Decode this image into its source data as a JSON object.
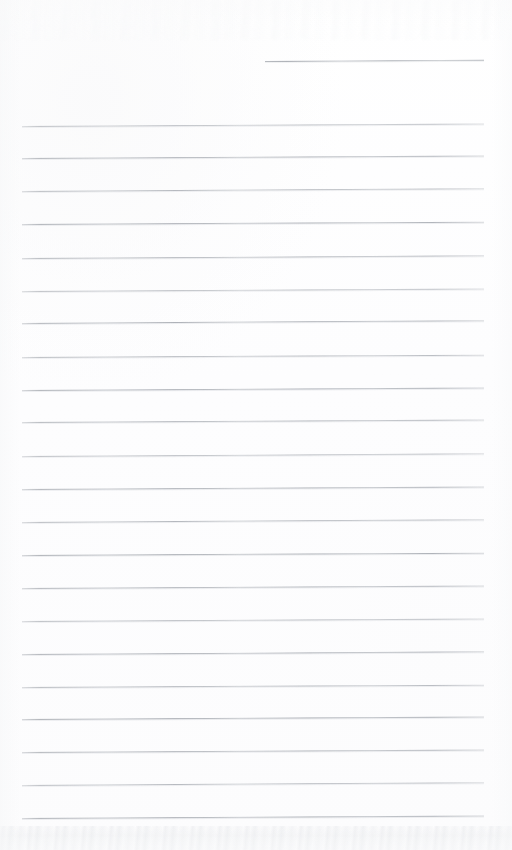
{
  "document": {
    "type": "blank-ruled-paper-scan",
    "title": "Blank Ruled Notebook Page",
    "page_width": 512,
    "page_height": 850,
    "background_color": "#fefefe",
    "rule_color": "#acb0b6",
    "rule_thickness_px": 1,
    "rule_left_x": 22,
    "rule_right_x": 484,
    "rule_spacing_px": 32.5,
    "written_text": "",
    "header_note": ""
  },
  "header_rule": {
    "label": "date-rule",
    "x": 265,
    "y": 61,
    "width": 219,
    "tilt_deg": -0.35
  },
  "rules": [
    {
      "y": 126,
      "tilt_deg": -0.32
    },
    {
      "y": 158,
      "tilt_deg": -0.3
    },
    {
      "y": 191,
      "tilt_deg": -0.34
    },
    {
      "y": 224,
      "tilt_deg": -0.28
    },
    {
      "y": 258,
      "tilt_deg": -0.33
    },
    {
      "y": 291,
      "tilt_deg": -0.3
    },
    {
      "y": 323,
      "tilt_deg": -0.35
    },
    {
      "y": 357,
      "tilt_deg": -0.29
    },
    {
      "y": 390,
      "tilt_deg": -0.32
    },
    {
      "y": 422,
      "tilt_deg": -0.31
    },
    {
      "y": 456,
      "tilt_deg": -0.33
    },
    {
      "y": 489,
      "tilt_deg": -0.3
    },
    {
      "y": 522,
      "tilt_deg": -0.34
    },
    {
      "y": 555,
      "tilt_deg": -0.28
    },
    {
      "y": 588,
      "tilt_deg": -0.32
    },
    {
      "y": 621,
      "tilt_deg": -0.31
    },
    {
      "y": 654,
      "tilt_deg": -0.33
    },
    {
      "y": 687,
      "tilt_deg": -0.29
    },
    {
      "y": 719,
      "tilt_deg": -0.32
    },
    {
      "y": 752,
      "tilt_deg": -0.3
    },
    {
      "y": 785,
      "tilt_deg": -0.34
    },
    {
      "y": 818,
      "tilt_deg": -0.31
    }
  ],
  "artifacts": {
    "bottom_ghost": {
      "y": 826,
      "height": 24,
      "description": "faint show-through handwriting ghost"
    },
    "top_ghost": {
      "y": 0,
      "height": 40,
      "description": "very faint scan ghosting"
    }
  }
}
